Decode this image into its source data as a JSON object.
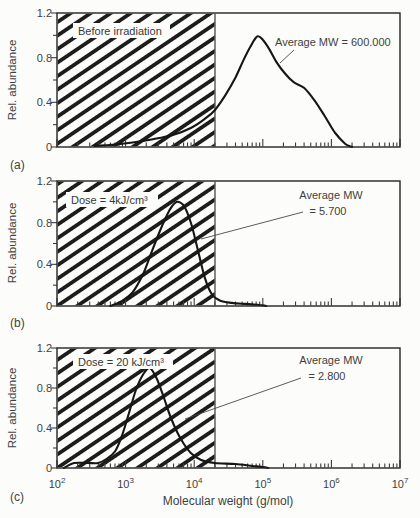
{
  "figure": {
    "xlabel": "Molecular weight (g/mol)",
    "ylabel": "Rel. abundance",
    "y_tick_labels": [
      "0",
      "0.4",
      "0.8",
      "1.2"
    ],
    "x_ticks": [
      {
        "base": "10",
        "exp": "2"
      },
      {
        "base": "10",
        "exp": "3"
      },
      {
        "base": "10",
        "exp": "4"
      },
      {
        "base": "10",
        "exp": "5"
      },
      {
        "base": "10",
        "exp": "6"
      },
      {
        "base": "10",
        "exp": "7"
      }
    ],
    "ink_color": "#1c1c1c",
    "background_color": "#fcfcfa"
  },
  "panels": [
    {
      "letter": "(a)",
      "condition": "Before irradiation",
      "annotation_line1": "Average MW = 600.000",
      "annotation_line2": ""
    },
    {
      "letter": "(b)",
      "condition": "Dose = 4kJ/cm³",
      "annotation_line1": "Average MW",
      "annotation_line2": "= 5.700"
    },
    {
      "letter": "(c)",
      "condition": "Dose = 20 kJ/cm³",
      "annotation_line1": "Average MW",
      "annotation_line2": "= 2.800"
    }
  ],
  "chart_data": [
    {
      "type": "line",
      "panel": "a",
      "title": "Before irradiation",
      "annotation": "Average MW = 600.000",
      "average_mw_g_per_mol": 600000,
      "xlabel": "Molecular weight (g/mol)",
      "ylabel": "Rel. abundance",
      "x_scale": "log10",
      "xlim_log10": [
        2,
        7
      ],
      "ylim": [
        0,
        1.2
      ],
      "hatched_region_log10": [
        2,
        4.3
      ],
      "x_log10": [
        2.55,
        2.8,
        3.1,
        3.4,
        3.7,
        3.95,
        4.15,
        4.3,
        4.45,
        4.6,
        4.72,
        4.82,
        4.92,
        5.0,
        5.1,
        5.2,
        5.32,
        5.45,
        5.6,
        5.75,
        5.9,
        6.05,
        6.2,
        6.3
      ],
      "rel_abundance": [
        0.01,
        0.02,
        0.04,
        0.07,
        0.11,
        0.17,
        0.25,
        0.33,
        0.46,
        0.62,
        0.78,
        0.9,
        0.99,
        0.96,
        0.87,
        0.76,
        0.66,
        0.58,
        0.53,
        0.42,
        0.28,
        0.13,
        0.03,
        0
      ]
    },
    {
      "type": "line",
      "panel": "b",
      "title": "Dose = 4kJ/cm³",
      "annotation": "Average MW = 5.700",
      "average_mw_g_per_mol": 5700,
      "xlabel": "Molecular weight (g/mol)",
      "ylabel": "Rel. abundance",
      "x_scale": "log10",
      "xlim_log10": [
        2,
        7
      ],
      "ylim": [
        0,
        1.2
      ],
      "hatched_region_log10": [
        2,
        4.3
      ],
      "x_log10": [
        2.78,
        2.95,
        3.1,
        3.25,
        3.38,
        3.5,
        3.6,
        3.68,
        3.76,
        3.86,
        3.96,
        4.06,
        4.16,
        4.26,
        4.38,
        4.55,
        4.75,
        4.95,
        5.05
      ],
      "rel_abundance": [
        0,
        0.05,
        0.13,
        0.3,
        0.52,
        0.72,
        0.87,
        0.96,
        1.0,
        0.95,
        0.78,
        0.52,
        0.26,
        0.11,
        0.05,
        0.03,
        0.02,
        0.01,
        0
      ]
    },
    {
      "type": "line",
      "panel": "c",
      "title": "Dose = 20 kJ/cm³",
      "annotation": "Average MW = 2.800",
      "average_mw_g_per_mol": 2800,
      "xlabel": "Molecular weight (g/mol)",
      "ylabel": "Rel. abundance",
      "x_scale": "log10",
      "xlim_log10": [
        2,
        7
      ],
      "ylim": [
        0,
        1.2
      ],
      "hatched_region_log10": [
        2,
        4.3
      ],
      "x_log10": [
        2.1,
        2.25,
        2.45,
        2.6,
        2.72,
        2.85,
        2.95,
        3.05,
        3.15,
        3.25,
        3.35,
        3.45,
        3.55,
        3.65,
        3.75,
        3.85,
        3.95,
        4.1,
        4.3,
        4.6,
        4.85,
        5.0,
        5.08
      ],
      "rel_abundance": [
        0,
        0.05,
        0.05,
        0.05,
        0.09,
        0.17,
        0.33,
        0.55,
        0.78,
        0.93,
        1.0,
        0.9,
        0.72,
        0.52,
        0.36,
        0.24,
        0.15,
        0.08,
        0.05,
        0.04,
        0.02,
        0.01,
        0
      ]
    }
  ]
}
